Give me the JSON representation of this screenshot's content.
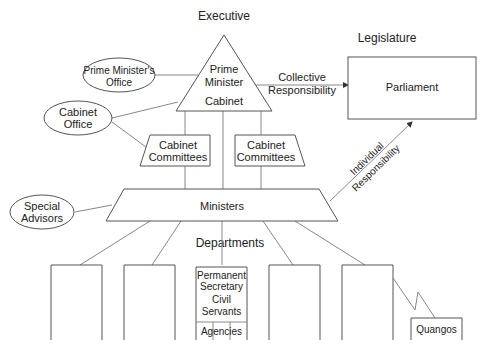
{
  "headings": {
    "executive": "Executive",
    "legislature": "Legislature",
    "departments": "Departments"
  },
  "nodes": {
    "prime_minister": {
      "line1": "Prime",
      "line2": "Minister"
    },
    "cabinet": "Cabinet",
    "pm_office": {
      "line1": "Prime Minister's",
      "line2": "Office"
    },
    "cabinet_office": {
      "line1": "Cabinet",
      "line2": "Office"
    },
    "cabinet_committees_left": {
      "line1": "Cabinet",
      "line2": "Committees"
    },
    "cabinet_committees_right": {
      "line1": "Cabinet",
      "line2": "Committees"
    },
    "parliament": "Parliament",
    "special_advisors": {
      "line1": "Special",
      "line2": "Advisors"
    },
    "ministers": "Ministers",
    "central_department": {
      "line1": "Permanent",
      "line2": "Secretary",
      "line3": "Civil",
      "line4": "Servants",
      "agencies": "Agencies"
    },
    "quangos": "Quangos"
  },
  "edges": {
    "collective": {
      "line1": "Collective",
      "line2": "Responsibility"
    },
    "individual": {
      "line1": "Individual",
      "line2": "Responsibility"
    }
  }
}
